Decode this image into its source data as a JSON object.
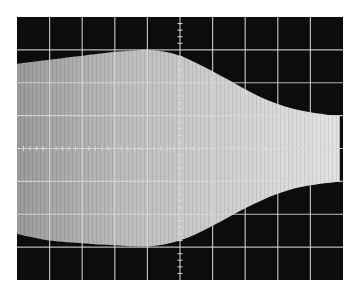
{
  "chart_data": {
    "type": "area",
    "title": "",
    "xlabel": "",
    "ylabel": "",
    "graticule": {
      "x_divisions": 10,
      "y_divisions": 8,
      "grid": true,
      "center_ticks": true,
      "minor_ticks_per_division": 5
    },
    "xlim": [
      0,
      10
    ],
    "ylim": [
      -4,
      4
    ],
    "envelope": {
      "x": [
        0,
        1,
        2,
        2.5,
        3,
        3.5,
        4,
        4.5,
        5,
        5.5,
        6,
        6.5,
        7,
        7.5,
        8,
        8.5,
        9,
        9.5,
        9.9
      ],
      "upper": [
        2.58,
        2.7,
        2.82,
        2.88,
        2.94,
        2.97,
        3.0,
        2.95,
        2.82,
        2.6,
        2.35,
        2.08,
        1.8,
        1.55,
        1.35,
        1.2,
        1.1,
        1.03,
        1.0
      ],
      "lower": [
        -2.6,
        -2.8,
        -2.88,
        -2.92,
        -2.94,
        -2.97,
        -2.98,
        -2.92,
        -2.8,
        -2.6,
        -2.35,
        -2.08,
        -1.82,
        -1.58,
        -1.38,
        -1.22,
        -1.12,
        -1.05,
        -1.0
      ]
    },
    "colors": {
      "background": "#ffffff",
      "screen": "#0c0c0c",
      "trace": "#e6e6e6",
      "grid": "#d8d8d8"
    }
  }
}
